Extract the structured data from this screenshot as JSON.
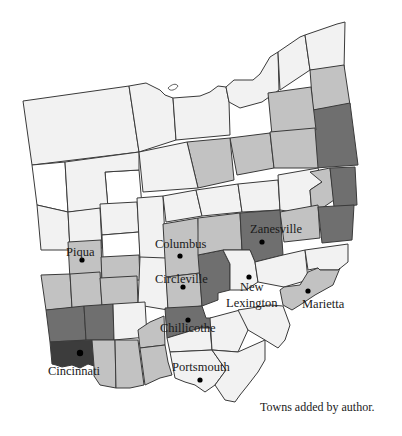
{
  "map": {
    "region": "Ohio",
    "caption": "Towns added by author.",
    "shades": {
      "white": "#ffffff",
      "lightest": "#f2f2f2",
      "light": "#c2c2c2",
      "medium": "#a9a9a9",
      "dark": "#6f6f6f",
      "darkest": "#3c3c3c"
    },
    "towns": [
      {
        "name": "Piqua",
        "x": 82,
        "y": 260,
        "label_x": 66,
        "label_y": 256
      },
      {
        "name": "Columbus",
        "x": 180,
        "y": 256,
        "label_x": 155,
        "label_y": 248
      },
      {
        "name": "Circleville",
        "x": 183,
        "y": 287,
        "label_x": 155,
        "label_y": 283
      },
      {
        "name": "Zanesville",
        "x": 262,
        "y": 242,
        "label_x": 250,
        "label_y": 233
      },
      {
        "name": "New",
        "x": 249,
        "y": 277,
        "label_x": 240,
        "label_y": 291
      },
      {
        "name": "Lexington",
        "x": 249,
        "y": 277,
        "label_x": 226,
        "label_y": 307
      },
      {
        "name": "Marietta",
        "x": 308,
        "y": 291,
        "label_x": 302,
        "label_y": 308
      },
      {
        "name": "Chillicothe",
        "x": 188,
        "y": 320,
        "label_x": 160,
        "label_y": 332
      },
      {
        "name": "Cincinnati",
        "x": 80,
        "y": 353,
        "label_x": 48,
        "label_y": 375
      },
      {
        "name": "Portsmouth",
        "x": 200,
        "y": 380,
        "label_x": 172,
        "label_y": 371
      }
    ]
  }
}
